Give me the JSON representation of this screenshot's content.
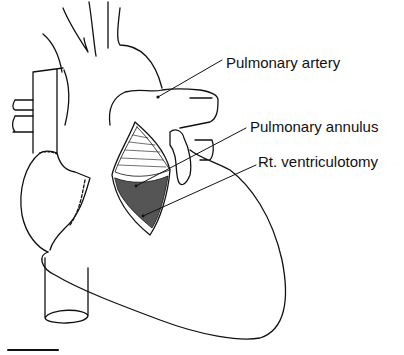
{
  "figure": {
    "labels": [
      {
        "text": "Pulmonary artery",
        "x": 226,
        "y": 51
      },
      {
        "text": "Pulmonary annulus",
        "x": 250,
        "y": 115
      },
      {
        "text": "Rt. ventriculotomy",
        "x": 258,
        "y": 150
      }
    ],
    "scale_bar": {
      "visible": true
    }
  }
}
